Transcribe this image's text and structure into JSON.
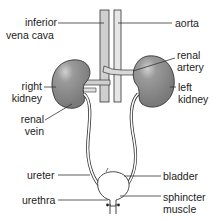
{
  "diagram": {
    "labels": {
      "inferior_vena_cava": [
        "inferior",
        "vena cava"
      ],
      "aorta": "aorta",
      "renal_artery": [
        "renal",
        "artery"
      ],
      "right_kidney": [
        "right",
        "kidney"
      ],
      "left_kidney": [
        "left",
        "kidney"
      ],
      "renal_vein": [
        "renal",
        "vein"
      ],
      "ureter": "ureter",
      "bladder": "bladder",
      "urethra": "urethra",
      "sphincter_muscle": [
        "sphincter",
        "muscle"
      ]
    },
    "colors": {
      "kidney_fill": "#8a8a8a",
      "kidney_highlight": "#c8c8c8",
      "vessel_fill": "#d8d8d8",
      "outline": "#333333",
      "text": "#222222"
    }
  }
}
